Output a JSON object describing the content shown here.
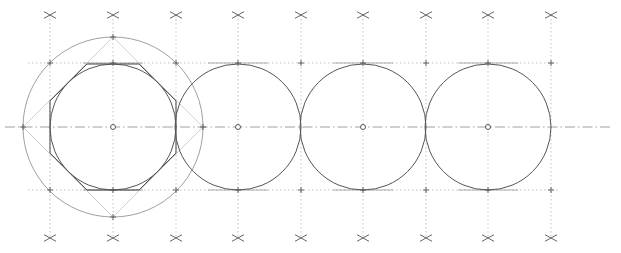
{
  "drawing": {
    "title": "Circles tangent along a centerline with circumscribed octagon construction",
    "width": 621,
    "height": 253,
    "colors": {
      "background": "#ffffff",
      "main_line": "#555555",
      "construction_line": "#9a9a9a",
      "diagonal_line": "#c4c4c4"
    },
    "centerline": {
      "y": 127,
      "x1": 5,
      "x2": 612
    },
    "tangent_lines": {
      "top_y": 63,
      "bottom_y": 190,
      "x1": 28,
      "x2": 560
    },
    "circles": [
      {
        "cx": 113,
        "cy": 127,
        "r": 63
      },
      {
        "cx": 238,
        "cy": 127,
        "r": 63
      },
      {
        "cx": 363,
        "cy": 127,
        "r": 63
      },
      {
        "cx": 488,
        "cy": 127,
        "r": 63
      }
    ],
    "circumscribed_circle": {
      "cx": 113,
      "cy": 127,
      "r": 90
    },
    "octagon_center": {
      "cx": 113,
      "cy": 127,
      "apothem": 63
    },
    "vertical_guides_x": [
      50,
      113,
      176,
      238,
      301,
      363,
      426,
      488,
      551
    ],
    "top_marks_y": 15,
    "bottom_marks_y": 238,
    "icons": {
      "cross_mark": "cross-mark-icon",
      "center_point": "center-point-icon"
    }
  }
}
